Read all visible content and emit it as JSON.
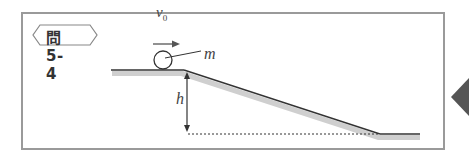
{
  "problem_label": "問 5-4",
  "labels": {
    "velocity": "v",
    "velocity_subscript": "0",
    "mass": "m",
    "height": "h"
  },
  "colors": {
    "frame": "#9a9a9a",
    "line": "#333333",
    "shadow": "#c8c8c8",
    "side_tab": "#555555"
  }
}
